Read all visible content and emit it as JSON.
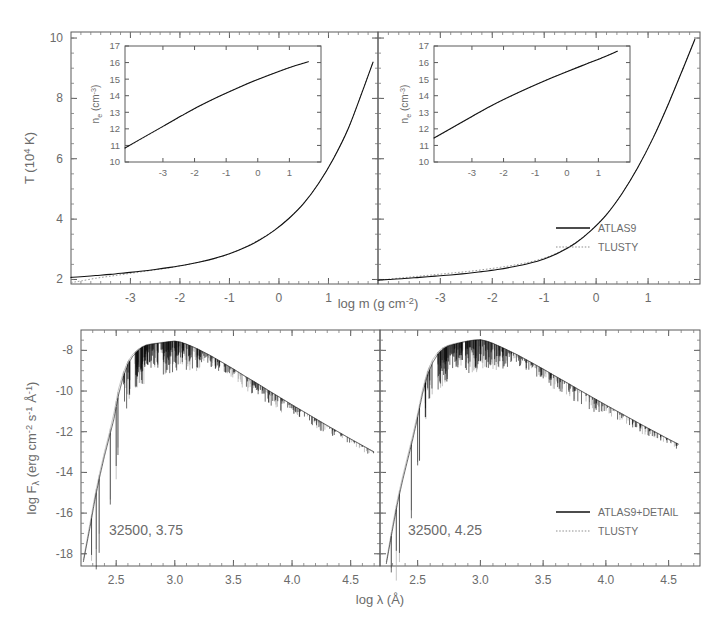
{
  "figure": {
    "width": 719,
    "height": 627,
    "background": "#ffffff",
    "ink_color": "#111111",
    "secondary_color": "#9a9a9a",
    "label_color": "#6b6b6b"
  },
  "chart_data": [
    {
      "id": "temperature-structure-left",
      "type": "line",
      "title": "",
      "xlabel": "log m (g cm^-2)",
      "ylabel": "T (10^4 K)",
      "xlim": [
        -4.2,
        2.0
      ],
      "ylim": [
        1.85,
        10.2
      ],
      "xticks": [
        -3,
        -2,
        -1,
        0,
        1
      ],
      "xticklabels": [
        "-3",
        "-2",
        "-1",
        "0",
        "1"
      ],
      "yticks": [
        2,
        4,
        6,
        8,
        10
      ],
      "yticklabels": [
        "2",
        "4",
        "6",
        "8",
        "10"
      ],
      "grid": false,
      "legend_position": "none",
      "series": [
        {
          "name": "ATLAS9",
          "style": "solid",
          "color": "#111111",
          "x": [
            -4.2,
            -4.0,
            -3.7,
            -3.4,
            -3.1,
            -2.8,
            -2.5,
            -2.2,
            -1.9,
            -1.6,
            -1.3,
            -1.0,
            -0.7,
            -0.4,
            -0.1,
            0.2,
            0.5,
            0.8,
            1.1,
            1.4,
            1.7,
            1.9
          ],
          "y": [
            2.07,
            2.09,
            2.13,
            2.17,
            2.22,
            2.27,
            2.33,
            2.4,
            2.48,
            2.58,
            2.7,
            2.85,
            3.05,
            3.3,
            3.62,
            4.02,
            4.52,
            5.18,
            6.0,
            7.0,
            8.3,
            9.2
          ]
        },
        {
          "name": "TLUSTY",
          "style": "dotted",
          "color": "#9a9a9a",
          "x": [
            -4.2,
            -4.0,
            -3.7,
            -3.4,
            -3.1,
            -2.8,
            -2.5,
            -2.2,
            -1.9,
            -1.6,
            -1.3,
            -1.0,
            -0.7,
            -0.4,
            -0.1,
            0.2,
            0.5,
            0.8,
            1.1,
            1.4,
            1.7,
            1.9
          ],
          "y": [
            1.9,
            1.95,
            2.04,
            2.11,
            2.18,
            2.25,
            2.32,
            2.39,
            2.48,
            2.58,
            2.7,
            2.85,
            3.06,
            3.32,
            3.63,
            4.03,
            4.53,
            5.19,
            6.01,
            7.01,
            8.31,
            9.21
          ]
        }
      ],
      "inset": {
        "id": "electron-density-inset-left",
        "type": "line",
        "xlabel": "",
        "ylabel": "n_e (cm^-3)",
        "xlim": [
          -4.2,
          2.0
        ],
        "ylim": [
          10,
          17
        ],
        "xticks": [
          -3,
          -2,
          -1,
          0,
          1
        ],
        "xticklabels": [
          "-3",
          "-2",
          "-1",
          "0",
          "1"
        ],
        "yticks": [
          10,
          11,
          12,
          13,
          14,
          15,
          16,
          17
        ],
        "yticklabels": [
          "10",
          "11",
          "12",
          "13",
          "14",
          "15",
          "16",
          "17"
        ],
        "series": [
          {
            "name": "ATLAS9",
            "style": "solid",
            "color": "#111111",
            "x": [
              -4.2,
              -3.6,
              -3.0,
              -2.4,
              -1.8,
              -1.2,
              -0.6,
              0.0,
              0.6,
              1.2,
              1.6
            ],
            "y": [
              10.85,
              11.5,
              12.15,
              12.8,
              13.42,
              13.98,
              14.5,
              14.98,
              15.42,
              15.82,
              16.05
            ]
          },
          {
            "name": "TLUSTY",
            "style": "dotted",
            "color": "#9a9a9a",
            "x": [
              -4.2,
              -3.6,
              -3.0,
              -2.4,
              -1.8,
              -1.2,
              -0.6,
              0.0,
              0.6,
              1.2,
              1.6
            ],
            "y": [
              10.82,
              11.48,
              12.13,
              12.79,
              13.41,
              13.98,
              14.51,
              14.99,
              15.43,
              15.83,
              16.06
            ]
          }
        ]
      }
    },
    {
      "id": "temperature-structure-right",
      "type": "line",
      "title": "",
      "xlabel": "log m (g cm^-2)",
      "ylabel": "",
      "xlim": [
        -4.2,
        2.0
      ],
      "ylim": [
        1.85,
        10.2
      ],
      "xticks": [
        -3,
        -2,
        -1,
        0,
        1
      ],
      "xticklabels": [
        "-3",
        "-2",
        "-1",
        "0",
        "1"
      ],
      "yticks": [
        2,
        4,
        6,
        8,
        10
      ],
      "yticklabels": [
        "",
        "",
        "",
        "",
        ""
      ],
      "grid": false,
      "legend_position": "right-middle",
      "legend_entries": [
        "ATLAS9",
        "TLUSTY"
      ],
      "series": [
        {
          "name": "ATLAS9",
          "style": "solid",
          "color": "#111111",
          "x": [
            -4.2,
            -4.0,
            -3.7,
            -3.4,
            -3.1,
            -2.8,
            -2.5,
            -2.2,
            -1.9,
            -1.6,
            -1.3,
            -1.0,
            -0.7,
            -0.4,
            -0.1,
            0.2,
            0.5,
            0.8,
            1.1,
            1.4,
            1.7,
            1.9
          ],
          "y": [
            1.98,
            2.0,
            2.03,
            2.07,
            2.11,
            2.15,
            2.2,
            2.26,
            2.33,
            2.42,
            2.53,
            2.68,
            2.9,
            3.2,
            3.62,
            4.15,
            4.85,
            5.7,
            6.7,
            7.85,
            9.1,
            9.95
          ]
        },
        {
          "name": "TLUSTY",
          "style": "dotted",
          "color": "#9a9a9a",
          "x": [
            -4.2,
            -4.0,
            -3.7,
            -3.4,
            -3.1,
            -2.8,
            -2.5,
            -2.2,
            -1.9,
            -1.6,
            -1.3,
            -1.0,
            -0.7,
            -0.4,
            -0.1,
            0.2,
            0.5,
            0.8,
            1.1,
            1.4,
            1.7,
            1.9
          ],
          "y": [
            1.97,
            2.01,
            2.06,
            2.11,
            2.16,
            2.21,
            2.26,
            2.32,
            2.39,
            2.47,
            2.57,
            2.71,
            2.92,
            3.22,
            3.63,
            4.16,
            4.86,
            5.71,
            6.71,
            7.86,
            9.11,
            9.96
          ]
        }
      ],
      "inset": {
        "id": "electron-density-inset-right",
        "type": "line",
        "xlabel": "",
        "ylabel": "n_e (cm^-3)",
        "xlim": [
          -4.2,
          2.0
        ],
        "ylim": [
          10,
          17
        ],
        "xticks": [
          -3,
          -2,
          -1,
          0,
          1
        ],
        "xticklabels": [
          "-3",
          "-2",
          "-1",
          "0",
          "1"
        ],
        "yticks": [
          10,
          11,
          12,
          13,
          14,
          15,
          16,
          17
        ],
        "yticklabels": [
          "10",
          "11",
          "12",
          "13",
          "14",
          "15",
          "16",
          "17"
        ],
        "series": [
          {
            "name": "ATLAS9",
            "style": "solid",
            "color": "#111111",
            "x": [
              -4.2,
              -3.6,
              -3.0,
              -2.4,
              -1.8,
              -1.2,
              -0.6,
              0.0,
              0.6,
              1.2,
              1.6
            ],
            "y": [
              11.45,
              12.1,
              12.75,
              13.38,
              13.95,
              14.48,
              14.98,
              15.45,
              15.9,
              16.35,
              16.68
            ]
          },
          {
            "name": "TLUSTY",
            "style": "dotted",
            "color": "#9a9a9a",
            "x": [
              -4.2,
              -3.6,
              -3.0,
              -2.4,
              -1.8,
              -1.2,
              -0.6,
              0.0,
              0.6,
              1.2,
              1.6
            ],
            "y": [
              11.42,
              12.08,
              12.73,
              13.37,
              13.94,
              14.48,
              14.99,
              15.46,
              15.91,
              16.36,
              16.69
            ]
          }
        ]
      }
    },
    {
      "id": "flux-spectrum-left",
      "type": "line",
      "title": "",
      "xlabel": "log lambda (A)",
      "ylabel": "log F_lambda (erg cm^-2 s^-1 A^-1)",
      "xlim": [
        2.2,
        4.75
      ],
      "ylim": [
        -18.6,
        -7.0
      ],
      "xticks": [
        2.5,
        3.0,
        3.5,
        4.0,
        4.5
      ],
      "xticklabels": [
        "2.5",
        "3.0",
        "3.5",
        "4.0",
        "4.5"
      ],
      "yticks": [
        -18,
        -16,
        -14,
        -12,
        -10,
        -8
      ],
      "yticklabels": [
        "-18",
        "-16",
        "-14",
        "-12",
        "-10",
        "-8"
      ],
      "grid": false,
      "annotation": "32500, 3.75",
      "legend_position": "none",
      "series": [
        {
          "name": "ATLAS9+DETAIL",
          "style": "solid",
          "color": "#0d0d0d",
          "x": [
            2.22,
            2.28,
            2.32,
            2.36,
            2.4,
            2.44,
            2.48,
            2.52,
            2.56,
            2.6,
            2.64,
            2.68,
            2.72,
            2.76,
            2.8,
            2.85,
            2.9,
            2.95,
            3.0,
            3.05,
            3.1,
            3.15,
            3.2,
            3.3,
            3.4,
            3.5,
            3.6,
            3.7,
            3.8,
            3.9,
            4.0,
            4.1,
            4.2,
            4.3,
            4.4,
            4.5,
            4.6,
            4.7
          ],
          "y": [
            -18.4,
            -16.6,
            -15.3,
            -14.2,
            -13.2,
            -12.3,
            -11.4,
            -10.2,
            -9.3,
            -8.7,
            -8.3,
            -8.05,
            -7.85,
            -7.75,
            -7.7,
            -7.66,
            -7.62,
            -7.58,
            -7.55,
            -7.6,
            -7.7,
            -7.82,
            -7.95,
            -8.25,
            -8.58,
            -8.92,
            -9.28,
            -9.62,
            -9.98,
            -10.33,
            -10.68,
            -11.02,
            -11.36,
            -11.7,
            -12.03,
            -12.36,
            -12.68,
            -13.0
          ]
        },
        {
          "name": "TLUSTY",
          "style": "dotted",
          "color": "#9d9d9d",
          "x": [
            2.22,
            2.28,
            2.32,
            2.36,
            2.4,
            2.44,
            2.48,
            2.52,
            2.56,
            2.6,
            2.64,
            2.68,
            2.72,
            2.76,
            2.8,
            2.85,
            2.9,
            2.95,
            3.0,
            3.05,
            3.1,
            3.15,
            3.2,
            3.3,
            3.4,
            3.5,
            3.6,
            3.7,
            3.8,
            3.9,
            4.0,
            4.1,
            4.2,
            4.3,
            4.4,
            4.5,
            4.6,
            4.7
          ],
          "y": [
            -18.3,
            -16.4,
            -15.1,
            -14.0,
            -13.0,
            -12.1,
            -11.1,
            -9.9,
            -9.1,
            -8.55,
            -8.2,
            -7.98,
            -7.82,
            -7.72,
            -7.68,
            -7.64,
            -7.6,
            -7.57,
            -7.54,
            -7.59,
            -7.69,
            -7.81,
            -7.94,
            -8.24,
            -8.57,
            -8.91,
            -9.27,
            -9.61,
            -9.97,
            -10.32,
            -10.67,
            -11.01,
            -11.35,
            -11.69,
            -12.02,
            -12.35,
            -12.67,
            -12.99
          ]
        }
      ]
    },
    {
      "id": "flux-spectrum-right",
      "type": "line",
      "title": "",
      "xlabel": "log lambda (A)",
      "ylabel": "",
      "xlim": [
        2.2,
        4.75
      ],
      "ylim": [
        -18.6,
        -7.0
      ],
      "xticks": [
        2.5,
        3.0,
        3.5,
        4.0,
        4.5
      ],
      "xticklabels": [
        "2.5",
        "3.0",
        "3.5",
        "4.0",
        "4.5"
      ],
      "yticks": [
        -18,
        -16,
        -14,
        -12,
        -10,
        -8
      ],
      "yticklabels": [
        "",
        "",
        "",
        "",
        "",
        ""
      ],
      "grid": false,
      "annotation": "32500, 4.25",
      "legend_position": "bottom-right",
      "legend_entries": [
        "ATLAS9+DETAIL",
        "TLUSTY"
      ],
      "series": [
        {
          "name": "ATLAS9+DETAIL",
          "style": "solid",
          "color": "#0d0d0d",
          "x": [
            2.25,
            2.3,
            2.34,
            2.38,
            2.42,
            2.46,
            2.5,
            2.54,
            2.58,
            2.62,
            2.66,
            2.7,
            2.74,
            2.78,
            2.82,
            2.86,
            2.9,
            2.95,
            3.0,
            3.05,
            3.1,
            3.15,
            3.2,
            3.3,
            3.4,
            3.5,
            3.6,
            3.7,
            3.8,
            3.9,
            4.0,
            4.1,
            4.2,
            4.3,
            4.4,
            4.5,
            4.58
          ],
          "y": [
            -18.5,
            -16.8,
            -15.5,
            -14.4,
            -13.4,
            -12.4,
            -11.3,
            -10.1,
            -9.2,
            -8.6,
            -8.2,
            -7.95,
            -7.8,
            -7.72,
            -7.66,
            -7.6,
            -7.55,
            -7.5,
            -7.48,
            -7.55,
            -7.66,
            -7.8,
            -7.94,
            -8.24,
            -8.58,
            -8.92,
            -9.28,
            -9.63,
            -9.99,
            -10.34,
            -10.69,
            -11.03,
            -11.37,
            -11.71,
            -12.04,
            -12.37,
            -12.62
          ]
        },
        {
          "name": "TLUSTY",
          "style": "dotted",
          "color": "#9d9d9d",
          "x": [
            2.25,
            2.3,
            2.34,
            2.38,
            2.42,
            2.46,
            2.5,
            2.54,
            2.58,
            2.62,
            2.66,
            2.7,
            2.74,
            2.78,
            2.82,
            2.86,
            2.9,
            2.95,
            3.0,
            3.05,
            3.1,
            3.15,
            3.2,
            3.3,
            3.4,
            3.5,
            3.6,
            3.7,
            3.8,
            3.9,
            4.0,
            4.1,
            4.2,
            4.3,
            4.4,
            4.5,
            4.58
          ],
          "y": [
            -18.4,
            -16.6,
            -15.3,
            -14.2,
            -13.2,
            -12.2,
            -11.1,
            -9.9,
            -9.0,
            -8.45,
            -8.1,
            -7.88,
            -7.76,
            -7.69,
            -7.63,
            -7.58,
            -7.53,
            -7.49,
            -7.47,
            -7.54,
            -7.65,
            -7.79,
            -7.93,
            -8.23,
            -8.57,
            -8.91,
            -9.27,
            -9.62,
            -9.98,
            -10.33,
            -10.68,
            -11.02,
            -11.36,
            -11.7,
            -12.03,
            -12.36,
            -12.61
          ]
        }
      ]
    }
  ],
  "labels": {
    "temperature_axis": {
      "base": "T (10",
      "exp": "4",
      "tail": " K)"
    },
    "density_axis": {
      "base": "n",
      "sub": "e",
      "mid": " (cm",
      "exp": "-3",
      "tail": ")"
    },
    "mass_axis": {
      "base": "log m (g cm",
      "exp": "-2",
      "tail": ")"
    },
    "flux_axis": {
      "base": "log F",
      "sub": "λ",
      "mid": " (erg cm",
      "exp1": "-2",
      "mid2": " s",
      "exp2": "-1",
      "mid3": " Å",
      "exp3": "-1",
      "tail": ")"
    },
    "wavelength_axis": "log λ (Å)"
  },
  "legends": {
    "top_right": {
      "entries": [
        {
          "label": "ATLAS9",
          "style": "solid"
        },
        {
          "label": "TLUSTY",
          "style": "dotted"
        }
      ]
    },
    "bottom_right": {
      "entries": [
        {
          "label": "ATLAS9+DETAIL",
          "style": "solid"
        },
        {
          "label": "TLUSTY",
          "style": "dotted"
        }
      ]
    }
  },
  "annotations": {
    "bottom_left": "32500, 3.75",
    "bottom_right": "32500, 4.25"
  }
}
